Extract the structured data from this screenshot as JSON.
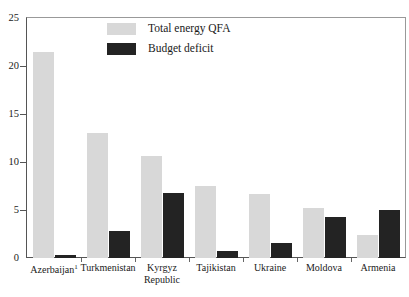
{
  "chart_data": {
    "type": "bar",
    "title": "",
    "xlabel": "",
    "ylabel": "",
    "ylim": [
      0,
      25
    ],
    "yticks": [
      0,
      5,
      10,
      15,
      20,
      25
    ],
    "grid": false,
    "legend_position": "top-center",
    "categories": [
      "Azerbaijan",
      "Turkmenistan",
      "Kyrgyz Republic",
      "Tajikistan",
      "Ukraine",
      "Moldova",
      "Armenia"
    ],
    "category_labels": [
      {
        "text": "Azerbaijan",
        "superscript": "1",
        "lines": [
          "Azerbaijan"
        ]
      },
      {
        "text": "Turkmenistan",
        "superscript": "",
        "lines": [
          "Turkmenistan"
        ]
      },
      {
        "text": "Kyrgyz Republic",
        "superscript": "",
        "lines": [
          "Kyrgyz",
          "Republic"
        ]
      },
      {
        "text": "Tajikistan",
        "superscript": "",
        "lines": [
          "Tajikistan"
        ]
      },
      {
        "text": "Ukraine",
        "superscript": "",
        "lines": [
          "Ukraine"
        ]
      },
      {
        "text": "Moldova",
        "superscript": "",
        "lines": [
          "Moldova"
        ]
      },
      {
        "text": "Armenia",
        "superscript": "",
        "lines": [
          "Armenia"
        ]
      }
    ],
    "series": [
      {
        "name": "Total energy QFA",
        "color": "#d8d8d8",
        "values": [
          21.5,
          13.0,
          10.6,
          7.5,
          6.7,
          5.2,
          2.4
        ]
      },
      {
        "name": "Budget deficit",
        "color": "#232323",
        "values": [
          0.3,
          2.8,
          6.8,
          0.7,
          1.6,
          4.3,
          5.0
        ]
      }
    ]
  },
  "legend": {
    "items": [
      {
        "label": "Total energy QFA",
        "color": "#d8d8d8"
      },
      {
        "label": "Budget deficit",
        "color": "#232323"
      }
    ]
  },
  "axis": {
    "y_tick_labels": [
      "0",
      "5",
      "10",
      "15",
      "20",
      "25"
    ]
  }
}
